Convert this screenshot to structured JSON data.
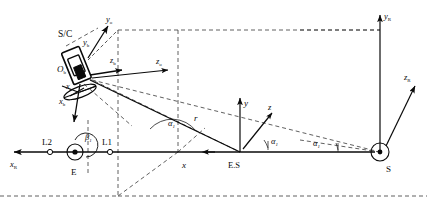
{
  "figure": {
    "background_color": "#ffffff",
    "line_color": "#0a0a0a"
  },
  "labels": {
    "spacecraft": "S/C",
    "body_origin": "O",
    "body_origin_sub": "b",
    "y_orbit": "y",
    "y_orbit_sub": "o",
    "y_body": "y",
    "y_body_sub": "b",
    "x_body": "x",
    "x_body_sub": "b",
    "x_orbit": "x",
    "x_orbit_sub": "o",
    "z_body": "z",
    "z_body_sub": "b",
    "z_orbit": "z",
    "z_orbit_sub": "o",
    "x_rot": "x",
    "x_rot_sub": "R",
    "y_rot": "y",
    "y_rot_sub": "R",
    "z_rot": "z",
    "z_rot_sub": "R",
    "earth": "E",
    "sun": "S",
    "earth_sun": "E.S",
    "lagrange_1": "L1",
    "lagrange_2": "L2",
    "radius": "r",
    "alpha_1": "α",
    "alpha_1_sub": "1",
    "alpha_2": "α",
    "alpha_2_sub": "1",
    "beta_1": "β",
    "beta_1_sub": "1",
    "es_x": "x",
    "es_y": "y",
    "es_z": "z"
  },
  "geometry": {
    "earth_center": [
      75,
      152
    ],
    "sun_center": [
      380,
      152
    ],
    "es_center": [
      240,
      152
    ],
    "sc_center": [
      76,
      70
    ],
    "l1_point": [
      110,
      152
    ],
    "l2_point": [
      50,
      152
    ]
  }
}
